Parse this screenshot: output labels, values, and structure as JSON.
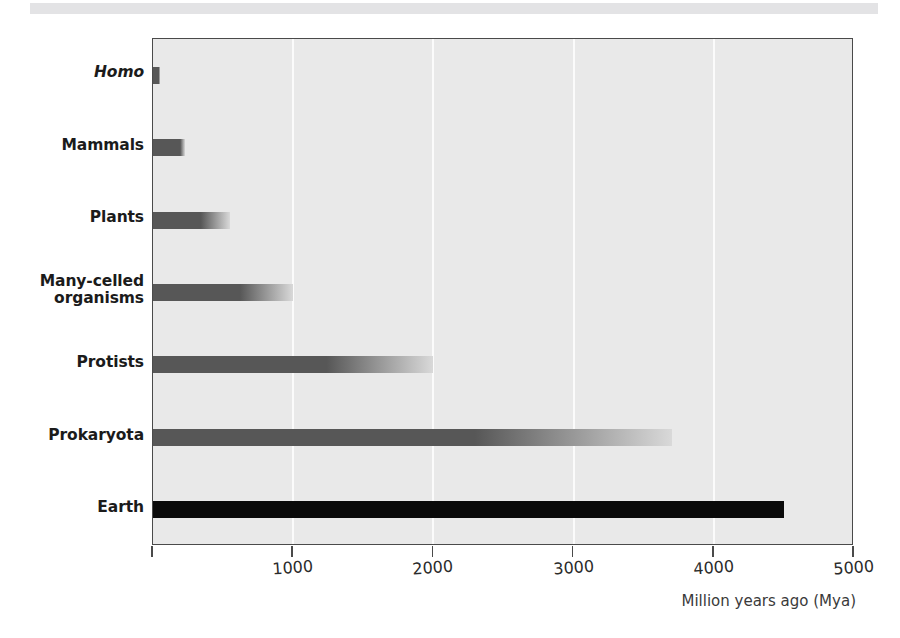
{
  "chart_data": {
    "type": "bar",
    "orientation": "horizontal",
    "title": "",
    "xlabel": "Million years ago (Mya)",
    "ylabel": "",
    "xlim": [
      0,
      5000
    ],
    "xticks": [
      0,
      1000,
      2000,
      3000,
      4000,
      5000
    ],
    "xticklabels": [
      "",
      "1000",
      "2000",
      "3000",
      "4000",
      "5000"
    ],
    "gridlines": [
      1000,
      2000,
      3000,
      4000
    ],
    "grid": true,
    "legend": null,
    "categories": [
      "Homo",
      "Mammals",
      "Plants",
      "Many-celled organisms",
      "Protists",
      "Prokaryota",
      "Earth"
    ],
    "values": [
      30,
      225,
      550,
      1000,
      2000,
      3700,
      4500
    ],
    "bars": [
      {
        "label": "Homo",
        "label_lines": [
          "Homo"
        ],
        "italic": true,
        "value": 30,
        "style": "gradient"
      },
      {
        "label": "Mammals",
        "label_lines": [
          "Mammals"
        ],
        "italic": false,
        "value": 225,
        "style": "gradient"
      },
      {
        "label": "Plants",
        "label_lines": [
          "Plants"
        ],
        "italic": false,
        "value": 550,
        "style": "gradient"
      },
      {
        "label": "Many-celled organisms",
        "label_lines": [
          "Many-celled",
          "organisms"
        ],
        "italic": false,
        "value": 1000,
        "style": "gradient"
      },
      {
        "label": "Protists",
        "label_lines": [
          "Protists"
        ],
        "italic": false,
        "value": 2000,
        "style": "gradient"
      },
      {
        "label": "Prokaryota",
        "label_lines": [
          "Prokaryota"
        ],
        "italic": false,
        "value": 3700,
        "style": "gradient"
      },
      {
        "label": "Earth",
        "label_lines": [
          "Earth"
        ],
        "italic": false,
        "value": 4500,
        "style": "solid"
      }
    ]
  },
  "colors": {
    "plot_background": "#e9e9e9",
    "plot_border": "#4a4a4a",
    "gridline": "#fbfbfb",
    "bar_dark": "#575757",
    "bar_fade": "#d9d9d9",
    "bar_solid": "#0a0a0a",
    "label_text": "#1b1b1b",
    "axis_text": "#2b2b2b",
    "top_strip": "#e3e3e5"
  }
}
